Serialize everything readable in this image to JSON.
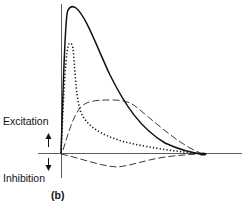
{
  "diagram": {
    "panel_label": "(b)",
    "labels": {
      "excitation": "Excitation",
      "inhibition": "Inhibition"
    },
    "arrows": {
      "up": "excitation-arrow-up",
      "down": "inhibition-arrow-down"
    },
    "curves": [
      {
        "name": "solid-total-response",
        "style": "solid",
        "description": "Fast rising peak then long decay to baseline"
      },
      {
        "name": "dotted-fast-excitation",
        "style": "dotted",
        "description": "Very fast, narrow excitatory peak"
      },
      {
        "name": "dashed-slow-excitation",
        "style": "long-dash",
        "description": "Slower, broad plateau excitation"
      },
      {
        "name": "dashed-inhibition",
        "style": "long-dash",
        "description": "Slow inhibitory component below baseline"
      }
    ],
    "colors": {
      "ink": "#111111",
      "background": "#ffffff"
    }
  }
}
